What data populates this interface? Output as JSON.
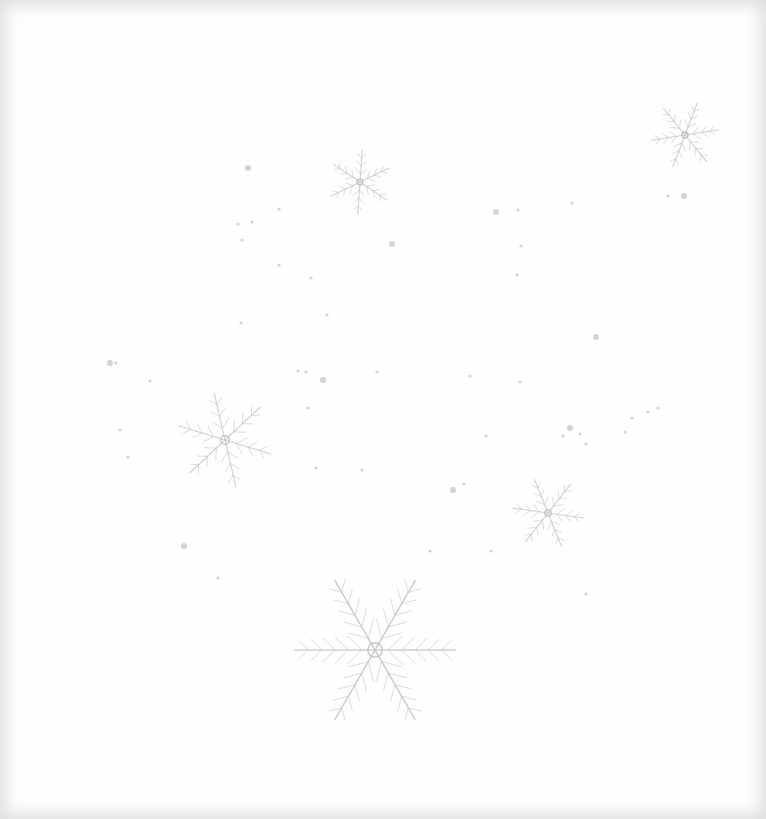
{
  "scene": {
    "description": "Faint gray dendritic ice crystals (snowflakes) and scattered specks on a white background",
    "background_color": "#fefefe",
    "crystal_color": "#c8c8c8",
    "speck_color": "#c4c4c4",
    "crystals": [
      {
        "name": "large-crystal",
        "cx": 375,
        "cy": 650,
        "r": 80,
        "arms": 6
      },
      {
        "name": "left-crystal",
        "cx": 225,
        "cy": 440,
        "r": 48,
        "arms": 6
      },
      {
        "name": "upper-middle-crystal",
        "cx": 360,
        "cy": 182,
        "r": 32,
        "arms": 6
      },
      {
        "name": "top-right-crystal",
        "cx": 685,
        "cy": 135,
        "r": 34,
        "arms": 6
      },
      {
        "name": "right-crystal",
        "cx": 548,
        "cy": 513,
        "r": 36,
        "arms": 6
      }
    ],
    "specks": [
      [
        248,
        168
      ],
      [
        238,
        224
      ],
      [
        252,
        222
      ],
      [
        242,
        240
      ],
      [
        279,
        209
      ],
      [
        392,
        244
      ],
      [
        279,
        265
      ],
      [
        311,
        278
      ],
      [
        327,
        315
      ],
      [
        241,
        323
      ],
      [
        110,
        363
      ],
      [
        116,
        363
      ],
      [
        150,
        381
      ],
      [
        298,
        371
      ],
      [
        306,
        372
      ],
      [
        323,
        380
      ],
      [
        308,
        408
      ],
      [
        377,
        372
      ],
      [
        316,
        468
      ],
      [
        362,
        470
      ],
      [
        184,
        546
      ],
      [
        218,
        578
      ],
      [
        430,
        551
      ],
      [
        491,
        551
      ],
      [
        586,
        594
      ],
      [
        496,
        212
      ],
      [
        518,
        210
      ],
      [
        572,
        203
      ],
      [
        521,
        246
      ],
      [
        517,
        275
      ],
      [
        596,
        337
      ],
      [
        470,
        376
      ],
      [
        520,
        382
      ],
      [
        486,
        436
      ],
      [
        464,
        484
      ],
      [
        453,
        490
      ],
      [
        632,
        418
      ],
      [
        648,
        412
      ],
      [
        658,
        408
      ],
      [
        625,
        432
      ],
      [
        570,
        428
      ],
      [
        580,
        434
      ],
      [
        586,
        444
      ],
      [
        563,
        436
      ],
      [
        668,
        196
      ],
      [
        684,
        196
      ],
      [
        128,
        457
      ],
      [
        120,
        430
      ]
    ]
  }
}
